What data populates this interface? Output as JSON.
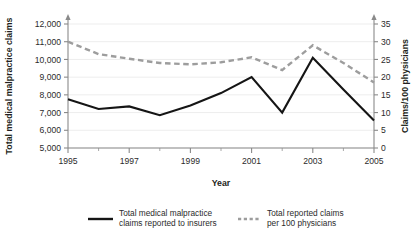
{
  "chart_data": {
    "type": "line",
    "title": "",
    "xlabel": "Year",
    "ylabel": "Total medical malpractice claims",
    "ylabel_right": "Claims/100 physicians",
    "x": [
      1995,
      1996,
      1997,
      1998,
      1999,
      2000,
      2001,
      2002,
      2003,
      2004,
      2005
    ],
    "xlim": [
      1995,
      2005
    ],
    "xticks": [
      1995,
      1997,
      1999,
      2001,
      2003,
      2005
    ],
    "xtick_labels": [
      "1995",
      "1997",
      "1999",
      "2001",
      "2003",
      "2005"
    ],
    "ylim": [
      5000,
      12000
    ],
    "yticks": [
      5000,
      6000,
      7000,
      8000,
      9000,
      10000,
      11000,
      12000
    ],
    "ytick_labels": [
      "5,000",
      "6,000",
      "7,000",
      "8,000",
      "9,000",
      "10,000",
      "11,000",
      "12,000"
    ],
    "ylim_right": [
      0,
      35
    ],
    "yticks_right": [
      0,
      5,
      10,
      15,
      20,
      25,
      30,
      35
    ],
    "ytick_labels_right": [
      "0",
      "5",
      "10",
      "15",
      "20",
      "25",
      "30",
      "35"
    ],
    "grid": true,
    "legend_position": "bottom",
    "series": [
      {
        "name": "Total medical malpractice claims reported to insurers",
        "axis": "left",
        "style": "solid",
        "color": "#151515",
        "values": [
          7750,
          7200,
          7350,
          6850,
          7400,
          8100,
          9000,
          7000,
          10100,
          8300,
          6550
        ]
      },
      {
        "name": "Total reported claims per 100 physicians",
        "axis": "right",
        "style": "dashed",
        "color": "#9d9d9d",
        "values": [
          30.0,
          26.5,
          25.2,
          24.0,
          23.6,
          24.2,
          25.6,
          22.0,
          29.0,
          24.0,
          18.5
        ]
      }
    ]
  },
  "legend": {
    "items": [
      {
        "line1": "Total medical malpractice",
        "line2": "claims reported to insurers",
        "style": "solid"
      },
      {
        "line1": "Total reported claims",
        "line2": "per 100 physicians",
        "style": "dashed"
      }
    ]
  }
}
